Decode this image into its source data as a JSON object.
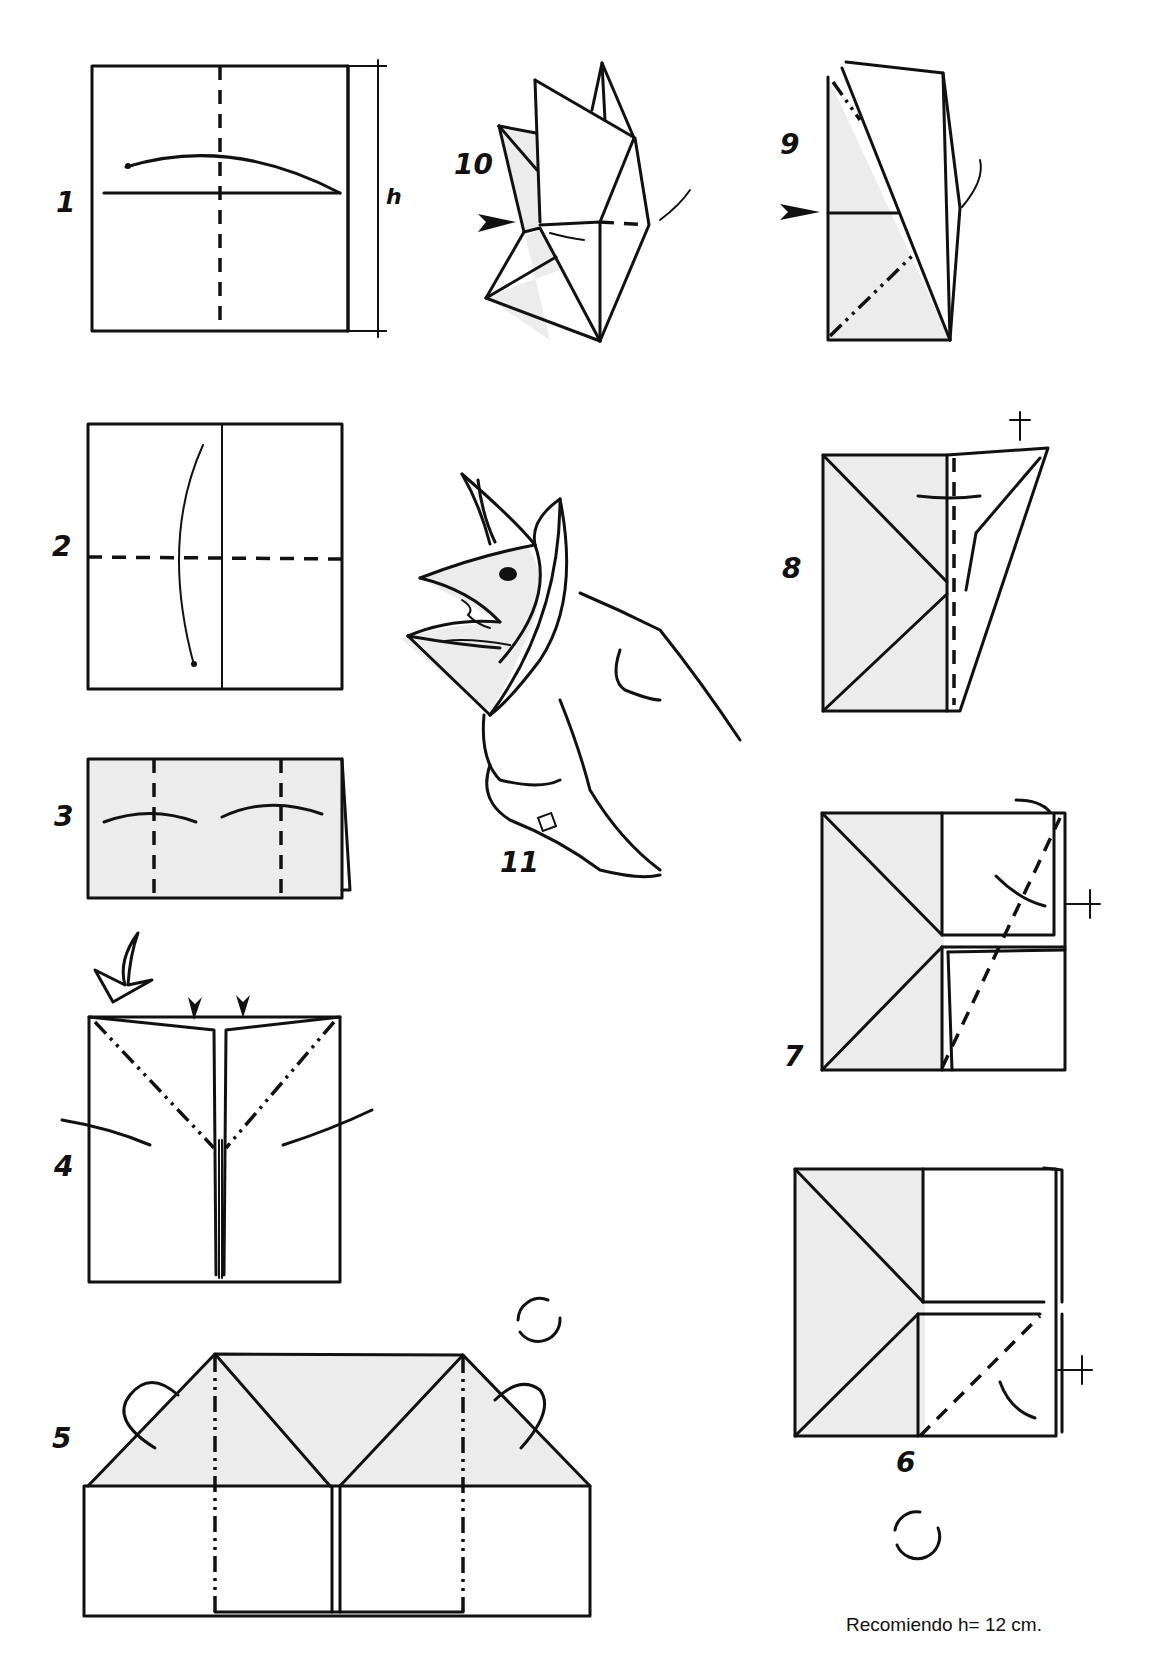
{
  "page": {
    "type": "origami-instruction-diagram",
    "colors": {
      "line": "#111111",
      "paper_shade": "#ececec",
      "background": "#ffffff"
    }
  },
  "steps": [
    {
      "number": "1",
      "label": "1",
      "dimension_label": "h"
    },
    {
      "number": "2",
      "label": "2"
    },
    {
      "number": "3",
      "label": "3"
    },
    {
      "number": "4",
      "label": "4"
    },
    {
      "number": "5",
      "label": "5"
    },
    {
      "number": "6",
      "label": "6"
    },
    {
      "number": "7",
      "label": "7"
    },
    {
      "number": "8",
      "label": "8"
    },
    {
      "number": "9",
      "label": "9"
    },
    {
      "number": "10",
      "label": "10"
    },
    {
      "number": "11",
      "label": "11"
    }
  ],
  "icons": {
    "fold_arrow": "curved-arrow-icon",
    "push_arrow": "push-arrow-icon",
    "turn_over": "turn-over-icon",
    "hollow_arrow": "hollow-arrow-icon"
  },
  "footer": {
    "note": "Recomiendo h= 12 cm."
  }
}
